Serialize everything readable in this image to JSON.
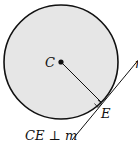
{
  "diagram": {
    "type": "geometry",
    "circle": {
      "cx": 61,
      "cy": 62,
      "r": 57,
      "fill": "#e6e6e6",
      "stroke": "#111111"
    },
    "center_label": "C",
    "point_label": "E",
    "line_label": "m",
    "caption": "CE ⊥ m",
    "colors": {
      "circle_fill": "#e6e6e6",
      "stroke": "#111111"
    }
  }
}
